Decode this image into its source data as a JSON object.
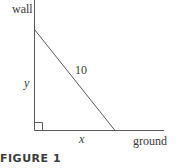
{
  "figure": {
    "caption": "FIGURE 1",
    "labels": {
      "wall": "wall",
      "ground": "ground",
      "vertical": "y",
      "horizontal": "x",
      "ladder_length": "10"
    },
    "colors": {
      "line": "#5a5a5a",
      "text": "#3a3a3a"
    }
  }
}
